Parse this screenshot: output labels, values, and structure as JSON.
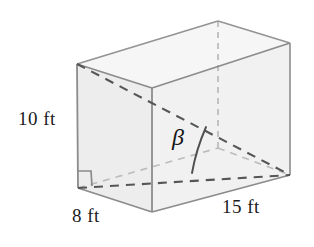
{
  "figure": {
    "kind": "rectangular-box-diagonal-angle",
    "labels": {
      "height": "10 ft",
      "depth": "8 ft",
      "width": "15 ft",
      "angle": "β"
    },
    "dimensions": {
      "height_value": 10,
      "depth_value": 8,
      "width_value": 15,
      "units": "ft"
    },
    "colors": {
      "face_fill": "#f3f3f3",
      "face_fill_light": "#f7f7f7",
      "solid_edge": "#8e8e8e",
      "hidden_edge_dark": "#5a5a5a",
      "hidden_edge_light": "#b9b9b9",
      "text": "#1b1b1b",
      "background": "#ffffff"
    },
    "markers": {
      "right_angle": "right-angle-square",
      "angle_arc": "beta-arc"
    }
  }
}
